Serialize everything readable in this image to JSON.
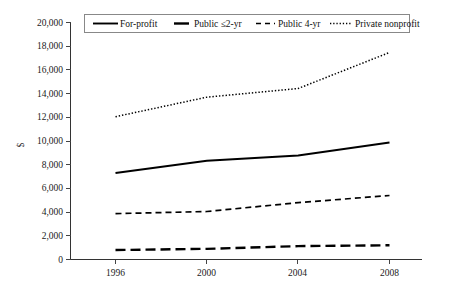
{
  "chart_data": {
    "type": "line",
    "title": "",
    "xlabel": "",
    "ylabel": "$",
    "x": [
      1996,
      2000,
      2004,
      2008
    ],
    "categories": [
      "1996",
      "2000",
      "2004",
      "2008"
    ],
    "xlim": [
      1996,
      2008
    ],
    "ylim": [
      0,
      20000
    ],
    "ytick_labels": [
      "20,000",
      "18,000",
      "16,000",
      "14,000",
      "12,000",
      "10,000",
      "8,000",
      "6,000",
      "4,000",
      "2,000",
      "0"
    ],
    "ytick_values": [
      20000,
      18000,
      16000,
      14000,
      12000,
      10000,
      8000,
      6000,
      4000,
      2000,
      0
    ],
    "ytick_step": 2000,
    "grid": false,
    "legend_position": "top-inside",
    "series": [
      {
        "name": "For-profit",
        "style": "solid",
        "color": "#000000",
        "values": [
          7300,
          8330,
          8780,
          9870
        ]
      },
      {
        "name": "Public ≤2-yr",
        "style": "long-dash",
        "color": "#000000",
        "values": [
          800,
          900,
          1130,
          1200
        ]
      },
      {
        "name": "Public 4-yr",
        "style": "short-dash",
        "color": "#000000",
        "values": [
          3870,
          4050,
          4800,
          5400
        ]
      },
      {
        "name": "Private nonprofit",
        "style": "dotted",
        "color": "#000000",
        "values": [
          12050,
          13700,
          14430,
          17470
        ]
      }
    ]
  },
  "legend": {
    "entries": [
      {
        "label": "For-profit",
        "style": "solid"
      },
      {
        "label": "Public ≤2-yr",
        "style": "long-dash"
      },
      {
        "label": "Public 4-yr",
        "style": "short-dash"
      },
      {
        "label": "Private nonprofit",
        "style": "dotted"
      }
    ]
  },
  "axes": {
    "y_title": "$",
    "x_tick_labels": [
      "1996",
      "2000",
      "2004",
      "2008"
    ],
    "y_tick_labels": [
      "20,000",
      "18,000",
      "16,000",
      "14,000",
      "12,000",
      "10,000",
      "8,000",
      "6,000",
      "4,000",
      "2,000",
      "0"
    ]
  }
}
